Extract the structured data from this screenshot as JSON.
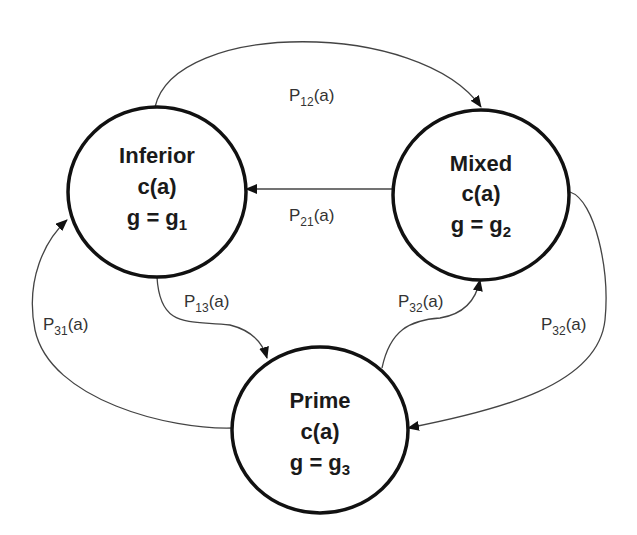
{
  "diagram": {
    "type": "state-transition",
    "colors": {
      "node_stroke": "#111111",
      "edge_stroke": "#444444",
      "text": "#1a1a1a",
      "background": "#ffffff"
    },
    "nodes": [
      {
        "id": "inferior",
        "title": "Inferior",
        "cost": "c(a)",
        "g_prefix": "g = g",
        "g_sub": "1"
      },
      {
        "id": "mixed",
        "title": "Mixed",
        "cost": "c(a)",
        "g_prefix": "g = g",
        "g_sub": "2"
      },
      {
        "id": "prime",
        "title": "Prime",
        "cost": "c(a)",
        "g_prefix": "g = g",
        "g_sub": "3"
      }
    ],
    "edges": [
      {
        "id": "p12",
        "from": "inferior",
        "to": "mixed",
        "label_main": "P",
        "label_sub": "12",
        "label_tail": "(a)"
      },
      {
        "id": "p21",
        "from": "mixed",
        "to": "inferior",
        "label_main": "P",
        "label_sub": "21",
        "label_tail": "(a)"
      },
      {
        "id": "p13",
        "from": "inferior",
        "to": "prime",
        "label_main": "P",
        "label_sub": "13",
        "label_tail": "(a)"
      },
      {
        "id": "p31",
        "from": "prime",
        "to": "inferior",
        "label_main": "P",
        "label_sub": "31",
        "label_tail": "(a)"
      },
      {
        "id": "p32",
        "from": "prime",
        "to": "mixed",
        "label_main": "P",
        "label_sub": "32",
        "label_tail": "(a)"
      },
      {
        "id": "p32b",
        "from": "mixed",
        "to": "prime",
        "label_main": "P",
        "label_sub": "32",
        "label_tail": "(a)"
      }
    ]
  }
}
